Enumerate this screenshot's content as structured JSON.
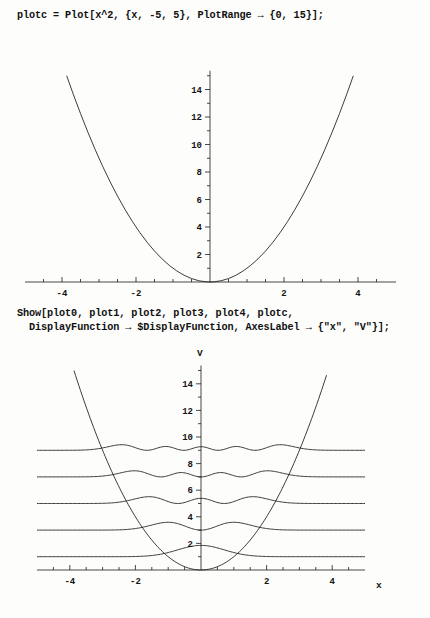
{
  "notebook": {
    "cells": [
      {
        "id": "code-1",
        "text": "plotc = Plot[x^2, {x, -5, 5}, PlotRange → {0, 15}];"
      },
      {
        "id": "code-2",
        "text": "Show[plot0, plot1, plot2, plot3, plot4, plotc,\n  DisplayFunction → $DisplayFunction, AxesLabel → {\"x\", \"V\"}];"
      }
    ]
  },
  "chart_data": [
    {
      "id": "plot-1",
      "type": "line",
      "title": "",
      "xlabel": "",
      "ylabel": "",
      "xlim": [
        -5,
        5
      ],
      "ylim": [
        0,
        15
      ],
      "grid": false,
      "legend": null,
      "xticks": [
        -4,
        -2,
        2,
        4
      ],
      "xticklabels": [
        "-4",
        "-2",
        "2",
        "4"
      ],
      "yticks": [
        2,
        4,
        6,
        8,
        10,
        12,
        14
      ],
      "yticklabels": [
        "2",
        "4",
        "6",
        "8",
        "10",
        "12",
        "14"
      ],
      "xminorticks": [
        -4.5,
        -3.5,
        -3,
        -2.5,
        -1.5,
        -1,
        -0.5,
        0.5,
        1,
        1.5,
        2.5,
        3,
        3.5,
        4.5
      ],
      "yminorticks": [
        1,
        3,
        5,
        7,
        9,
        11,
        13,
        15
      ],
      "series": [
        {
          "name": "V = x^2",
          "expression": "x^2",
          "x": [
            -3.873,
            -3.7,
            -3.5,
            -3.3,
            -3.1,
            -2.9,
            -2.7,
            -2.5,
            -2.3,
            -2.1,
            -1.9,
            -1.7,
            -1.5,
            -1.3,
            -1.1,
            -0.9,
            -0.7,
            -0.5,
            -0.3,
            -0.1,
            0,
            0.1,
            0.3,
            0.5,
            0.7,
            0.9,
            1.1,
            1.3,
            1.5,
            1.7,
            1.9,
            2.1,
            2.3,
            2.5,
            2.7,
            2.9,
            3.1,
            3.3,
            3.5,
            3.7,
            3.873
          ],
          "y": [
            15,
            13.69,
            12.25,
            10.89,
            9.61,
            8.41,
            7.29,
            6.25,
            5.29,
            4.41,
            3.61,
            2.89,
            2.25,
            1.69,
            1.21,
            0.81,
            0.49,
            0.25,
            0.09,
            0.01,
            0,
            0.01,
            0.09,
            0.25,
            0.49,
            0.81,
            1.21,
            1.69,
            2.25,
            2.89,
            3.61,
            4.41,
            5.29,
            6.25,
            7.29,
            8.41,
            9.61,
            10.89,
            12.25,
            13.69,
            15
          ]
        }
      ]
    },
    {
      "id": "plot-2",
      "type": "line",
      "title": "",
      "xlabel": "x",
      "ylabel": "V",
      "xlim": [
        -5,
        5
      ],
      "ylim": [
        0,
        15
      ],
      "grid": false,
      "legend": null,
      "xticks": [
        -4,
        -2,
        2,
        4
      ],
      "xticklabels": [
        "-4",
        "-2",
        "2",
        "4"
      ],
      "yticks": [
        2,
        4,
        6,
        8,
        10,
        12,
        14
      ],
      "yticklabels": [
        "2",
        "4",
        "6",
        "8",
        "10",
        "12",
        "14"
      ],
      "xminorticks": [
        -4.5,
        -3.5,
        -3,
        -2.5,
        -1.5,
        -1,
        -0.5,
        0.5,
        1,
        1.5,
        2.5,
        3,
        3.5,
        4.5
      ],
      "yminorticks": [
        1,
        3,
        5,
        7,
        9,
        11,
        13,
        15
      ],
      "series": [
        {
          "name": "V = x^2 (plotc)",
          "expression": "x^2",
          "type": "potential"
        },
        {
          "name": "plot0",
          "expression": "psi_0(x)^2 offset to E = 1",
          "level": 1,
          "nodes": 0,
          "amplitude": 0.85
        },
        {
          "name": "plot1",
          "expression": "psi_1(x)^2 offset to E = 3",
          "level": 3,
          "nodes": 1,
          "amplitude": 0.8
        },
        {
          "name": "plot2",
          "expression": "psi_2(x)^2 offset to E = 5",
          "level": 5,
          "nodes": 2,
          "amplitude": 0.78
        },
        {
          "name": "plot3",
          "expression": "psi_3(x)^2 offset to E = 7",
          "level": 7,
          "nodes": 3,
          "amplitude": 0.75
        },
        {
          "name": "plot4",
          "expression": "psi_4(x)^2 offset to E = 9",
          "level": 9,
          "nodes": 4,
          "amplitude": 0.72
        }
      ]
    }
  ]
}
